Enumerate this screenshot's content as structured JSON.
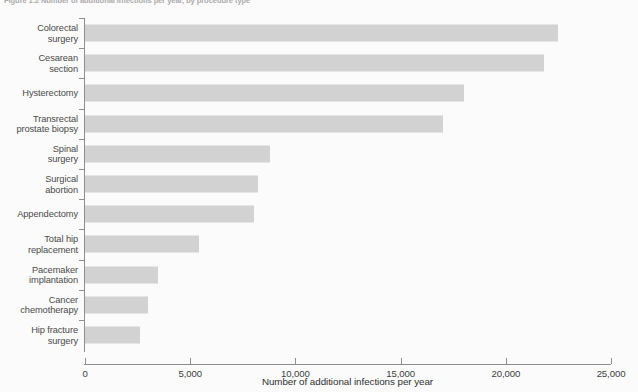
{
  "figure": {
    "caption": "Figure 1.2  Number of additional infections per year, by procedure type"
  },
  "chart_data": {
    "type": "bar",
    "orientation": "horizontal",
    "title": "",
    "xlabel": "Number of additional infections per year",
    "ylabel": "",
    "xlim": [
      0,
      25000
    ],
    "grid": false,
    "legend": null,
    "bar_color": "#d2d2d2",
    "axis_color": "#8e8e8e",
    "background_color": "#fbfbfb",
    "xticks": [
      0,
      5000,
      10000,
      15000,
      20000,
      25000
    ],
    "xtick_labels": [
      "0",
      "5,000",
      "10,000",
      "15,000",
      "20,000",
      "25,000"
    ],
    "categories": [
      "Colorectal\nsurgery",
      "Cesarean\nsection",
      "Hysterectomy",
      "Transrectal\nprostate biopsy",
      "Spinal\nsurgery",
      "Surgical\nabortion",
      "Appendectomy",
      "Total hip\nreplacement",
      "Pacemaker\nimplantation",
      "Cancer\nchemotherapy",
      "Hip fracture\nsurgery"
    ],
    "values": [
      22500,
      21800,
      18000,
      17000,
      8800,
      8200,
      8050,
      5400,
      3450,
      3000,
      2600
    ]
  }
}
